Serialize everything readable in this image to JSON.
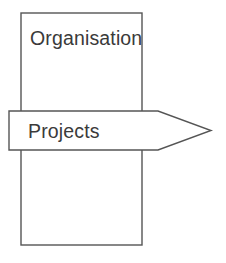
{
  "diagram": {
    "background_color": "#ffffff",
    "stroke_color": "#555555",
    "text_color": "#3a3a3a",
    "shapes": {
      "organisation_box": {
        "kind": "rectangle",
        "label": "Organisation",
        "x": 21,
        "y": 13,
        "width": 121,
        "height": 232,
        "fill": "#ffffff",
        "stroke": "#555555",
        "label_x": 30,
        "label_y": 45
      },
      "projects_arrow": {
        "kind": "right-arrow",
        "label": "Projects",
        "x": 9,
        "y": 111,
        "width": 202,
        "height": 39,
        "shoulder_x": 158,
        "tip_x": 211,
        "tip_y": 131,
        "points": "9,111 158,111 211,130.5 158,150 9,150",
        "fill": "#ffffff",
        "stroke": "#555555",
        "label_x": 28,
        "label_y": 138
      }
    }
  }
}
